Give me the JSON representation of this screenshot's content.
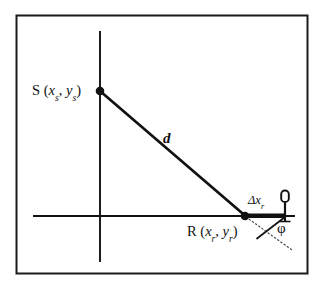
{
  "figure": {
    "type": "geometry-diagram",
    "caption": "",
    "frame": {
      "border_color": "#1a1a1a",
      "background": "#ffffff",
      "x": 16,
      "y": 15,
      "width": 291,
      "height": 258
    },
    "colors": {
      "stroke": "#111111",
      "dotted": "#555555",
      "fill": "#ffffff"
    },
    "axes": {
      "vertical": {
        "x": 100,
        "y_top": 31,
        "y_bottom": 262
      },
      "horizontal": {
        "y": 216,
        "x_left": 33,
        "x_right": 295
      }
    },
    "points": [
      {
        "id": "S",
        "label_letter": "S",
        "coord_x": "x",
        "coord_x_sub": "s",
        "coord_y": "y",
        "coord_y_sub": "s",
        "label_full": "S (xs, ys)",
        "px": 100,
        "py": 91,
        "marker": "filled-circle"
      },
      {
        "id": "R",
        "label_letter": "R",
        "coord_x": "x",
        "coord_x_sub": "r",
        "coord_y": "y",
        "coord_y_sub": "r",
        "label_full": "R (xr, yr)",
        "px": 245,
        "py": 216,
        "marker": "filled-circle"
      }
    ],
    "segments": [
      {
        "id": "distance-d",
        "label": "d",
        "label_style": "italic",
        "from": "S",
        "to": "R",
        "from_px": [
          100,
          91
        ],
        "to_px": [
          245,
          216
        ],
        "stroke_width": 2.6,
        "style": "solid"
      },
      {
        "id": "receiver-spacing",
        "label_base": "Δx",
        "label_sub": "r",
        "label_full": "Δxr",
        "from_px": [
          245,
          216
        ],
        "to_px": [
          285,
          216
        ],
        "stroke_width": 4.2,
        "style": "solid-thick"
      },
      {
        "id": "dip-reference-line",
        "from_px": [
          245,
          216
        ],
        "to_px": [
          291,
          249
        ],
        "style": "dotted"
      },
      {
        "id": "dip-line",
        "from_px": [
          285,
          217
        ],
        "to_px": [
          258,
          238
        ],
        "style": "solid"
      }
    ],
    "angles": [
      {
        "id": "phi",
        "symbol": "φ",
        "vertex_px": [
          285,
          217
        ],
        "label_px": [
          279,
          222
        ]
      }
    ],
    "symbols": [
      {
        "id": "geophone",
        "name": "geophone-symbol",
        "px": 285,
        "py": 216,
        "head_width": 7,
        "head_height": 11,
        "stem_height": 12
      }
    ]
  },
  "labels": {
    "source_point": "S",
    "receiver_point": "R",
    "distance": "d",
    "receiver_spacing_base": "Δx",
    "receiver_spacing_sub": "r",
    "dip_angle": "φ",
    "open_paren": "(",
    "close_paren": ")",
    "comma": ",",
    "coord_x_letter": "x",
    "coord_y_letter": "y",
    "source_sub": "s",
    "receiver_sub": "r"
  }
}
